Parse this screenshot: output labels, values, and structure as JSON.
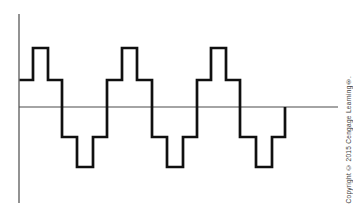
{
  "figure": {
    "background": "#ffffff",
    "axes": {
      "color": "#4a4a4a",
      "stroke_width": 1.2,
      "x_axis": {
        "x1": 19,
        "y1": 107,
        "x2": 338,
        "y2": 107
      },
      "y_axis": {
        "x1": 19,
        "y1": 14,
        "x2": 19,
        "y2": 203
      }
    },
    "waveform": {
      "type": "stepped-square-wave",
      "cycles": 3,
      "color": "#101010",
      "stroke_width": 2.7,
      "levels_px": {
        "peak": 48,
        "mid_high": 80,
        "zero": 107,
        "mid_low": 137,
        "trough": 167
      },
      "points": [
        [
          19.5,
          80
        ],
        [
          33,
          80
        ],
        [
          33,
          48
        ],
        [
          48,
          48
        ],
        [
          48,
          80
        ],
        [
          62,
          80
        ],
        [
          62,
          137
        ],
        [
          77,
          137
        ],
        [
          77,
          167
        ],
        [
          93,
          167
        ],
        [
          93,
          137
        ],
        [
          107,
          137
        ],
        [
          107,
          80
        ],
        [
          122,
          80
        ],
        [
          122,
          48
        ],
        [
          137,
          48
        ],
        [
          137,
          80
        ],
        [
          152,
          80
        ],
        [
          152,
          137
        ],
        [
          167,
          137
        ],
        [
          167,
          167
        ],
        [
          183,
          167
        ],
        [
          183,
          137
        ],
        [
          197,
          137
        ],
        [
          197,
          80
        ],
        [
          211,
          80
        ],
        [
          211,
          48
        ],
        [
          226,
          48
        ],
        [
          226,
          80
        ],
        [
          240,
          80
        ],
        [
          240,
          137
        ],
        [
          256,
          137
        ],
        [
          256,
          167
        ],
        [
          272,
          167
        ],
        [
          272,
          137
        ],
        [
          285,
          137
        ],
        [
          285,
          107
        ]
      ]
    }
  },
  "copyright": {
    "text": "Copyright © 2015 Cengage Learning®."
  }
}
